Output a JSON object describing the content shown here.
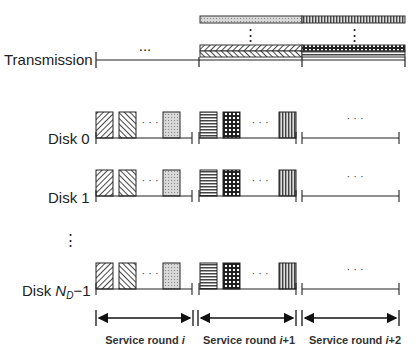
{
  "diagram": {
    "transmission": {
      "label": "Transmission",
      "ellipsis": "...",
      "top_bar_segments": [
        "light-dotted",
        "vertical-lines"
      ],
      "stack_segments_left": [
        "diagonal-right",
        "diagonal-left"
      ],
      "stack_segments_right": [
        "grid-dots",
        "horizontal-lines"
      ]
    },
    "disks": [
      {
        "label": "Disk 0"
      },
      {
        "label": "Disk 1"
      },
      {
        "label_prefix": "Disk ",
        "label_var": "N",
        "label_sub": "D",
        "label_suffix": "−1"
      }
    ],
    "vertical_ellipsis": "⋮",
    "block_ellipsis": "· · ·",
    "rounds": [
      {
        "prefix": "Service round ",
        "var": "i",
        "suffix": ""
      },
      {
        "prefix": "Service round ",
        "var": "i",
        "suffix": "+1"
      },
      {
        "prefix": "Service round ",
        "var": "i",
        "suffix": "+2"
      }
    ]
  }
}
